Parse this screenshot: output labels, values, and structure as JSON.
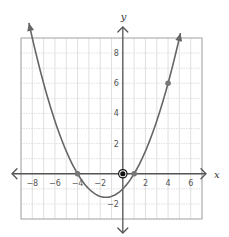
{
  "chart_data": {
    "type": "line",
    "title": "",
    "xlabel": "x",
    "ylabel": "y",
    "xlim": [
      -9,
      7
    ],
    "ylim": [
      -3,
      9
    ],
    "grid": true,
    "x_ticks": [
      -8,
      -6,
      -4,
      -2,
      2,
      4,
      6
    ],
    "y_ticks": [
      -2,
      2,
      4,
      6,
      8
    ],
    "series": [
      {
        "name": "parabola",
        "equation": "y = 0.25(x + 4)(x - 1)",
        "x_range": [
          -8.3,
          5.1
        ],
        "color": "#666666"
      }
    ],
    "points": [
      {
        "x": -4,
        "y": 0,
        "style": "point"
      },
      {
        "x": 0,
        "y": 0,
        "style": "highlighted"
      },
      {
        "x": 1,
        "y": 0,
        "style": "point"
      },
      {
        "x": 4,
        "y": 6,
        "style": "point"
      }
    ]
  },
  "colors": {
    "axis": "#555555",
    "grid": "#d8d8d8",
    "curve": "#666666",
    "point": "#777777",
    "highlight": "#111111"
  }
}
